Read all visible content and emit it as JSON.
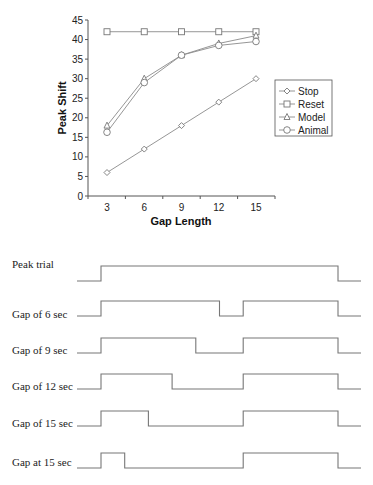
{
  "chart_data": [
    {
      "type": "line",
      "title": "",
      "xlabel": "Gap Length",
      "ylabel": "Peak Shift",
      "x": [
        3,
        6,
        9,
        12,
        15
      ],
      "categories": [
        "3",
        "6",
        "9",
        "12",
        "15"
      ],
      "ylim": [
        0,
        45
      ],
      "yticks": [
        0,
        5,
        10,
        15,
        20,
        25,
        30,
        35,
        40,
        45
      ],
      "grid": false,
      "legend_position": "right",
      "series": [
        {
          "name": "Stop",
          "marker": "diamond",
          "values": [
            6,
            12,
            18,
            24,
            30
          ]
        },
        {
          "name": "Reset",
          "marker": "square",
          "values": [
            42,
            42,
            42,
            42,
            42
          ]
        },
        {
          "name": "Model",
          "marker": "triangle",
          "values": [
            18,
            30,
            36,
            39,
            41
          ]
        },
        {
          "name": "Animal",
          "marker": "circle",
          "values": [
            16.3,
            29,
            36,
            38.5,
            39.5
          ]
        }
      ]
    },
    {
      "type": "diagram",
      "title": "Timing diagrams of trial types",
      "rows": [
        {
          "label": "Peak trial",
          "on_segments": [
            [
              0,
              1
            ]
          ]
        },
        {
          "label": "Gap of 6 sec",
          "on_segments": [
            [
              0,
              0.5
            ],
            [
              0.6,
              1
            ]
          ]
        },
        {
          "label": "Gap of 9 sec",
          "on_segments": [
            [
              0,
              0.4
            ],
            [
              0.6,
              1
            ]
          ]
        },
        {
          "label": "Gap of 12 sec",
          "on_segments": [
            [
              0,
              0.3
            ],
            [
              0.6,
              1
            ]
          ]
        },
        {
          "label": "Gap of 15 sec",
          "on_segments": [
            [
              0,
              0.2
            ],
            [
              0.6,
              1
            ]
          ]
        },
        {
          "label": "Gap at 15 sec",
          "on_segments": [
            [
              0,
              0.1
            ],
            [
              0.6,
              1
            ]
          ]
        }
      ]
    }
  ],
  "colors": {
    "axis": "#555555",
    "series_line": "#8a8a8a",
    "timing_line": "#777777",
    "text": "#222222"
  }
}
